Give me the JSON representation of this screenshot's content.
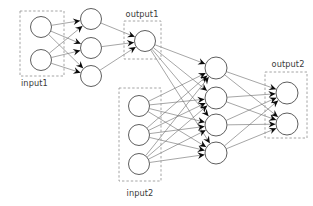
{
  "diagram": {
    "type": "neural-network",
    "canvas": {
      "width": 313,
      "height": 206
    },
    "style": {
      "background": "#ffffff",
      "node_fill": "#ffffff",
      "node_stroke": "#555555",
      "edge_color": "#6e6e6e",
      "box_color": "#9a9a9a",
      "arrow_color": "#0b0b0b",
      "label_color": "#3b3b3b"
    },
    "labels": {
      "input1": "input1",
      "output1": "output1",
      "input2": "input2",
      "output2": "output2"
    },
    "label_positions": {
      "input1": {
        "x": 21,
        "y": 86,
        "anchor": "start"
      },
      "output1": {
        "x": 142,
        "y": 17,
        "anchor": "middle"
      },
      "input2": {
        "x": 140,
        "y": 196,
        "anchor": "middle"
      },
      "output2": {
        "x": 288,
        "y": 67,
        "anchor": "middle"
      }
    },
    "groups": [
      {
        "id": "input1",
        "label": "input1",
        "x": 20,
        "y": 11,
        "width": 44,
        "height": 65
      },
      {
        "id": "output1",
        "label": "output1",
        "x": 124,
        "y": 21,
        "width": 37,
        "height": 38
      },
      {
        "id": "input2",
        "label": "input2",
        "x": 119,
        "y": 88,
        "width": 42,
        "height": 93
      },
      {
        "id": "output2",
        "label": "output2",
        "x": 265,
        "y": 72,
        "width": 42,
        "height": 66
      }
    ],
    "layers": [
      {
        "id": "input1",
        "name": "input layer 1",
        "node_radius": 10.5,
        "nodes": [
          {
            "id": "i1a",
            "cx": 41,
            "cy": 27
          },
          {
            "id": "i1b",
            "cx": 41,
            "cy": 60
          }
        ]
      },
      {
        "id": "hidden1",
        "name": "hidden layer 1",
        "node_radius": 10.5,
        "nodes": [
          {
            "id": "h1a",
            "cx": 91,
            "cy": 19
          },
          {
            "id": "h1b",
            "cx": 91,
            "cy": 48
          },
          {
            "id": "h1c",
            "cx": 91,
            "cy": 76
          }
        ]
      },
      {
        "id": "output1",
        "name": "output layer 1",
        "node_radius": 10.5,
        "nodes": [
          {
            "id": "o1a",
            "cx": 145,
            "cy": 41
          }
        ]
      },
      {
        "id": "input2",
        "name": "input layer 2",
        "node_radius": 10.5,
        "nodes": [
          {
            "id": "i2a",
            "cx": 139,
            "cy": 106
          },
          {
            "id": "i2b",
            "cx": 139,
            "cy": 135
          },
          {
            "id": "i2c",
            "cx": 139,
            "cy": 164
          }
        ]
      },
      {
        "id": "hidden2",
        "name": "hidden layer 2",
        "node_radius": 11,
        "nodes": [
          {
            "id": "h2a",
            "cx": 216,
            "cy": 68
          },
          {
            "id": "h2b",
            "cx": 216,
            "cy": 98
          },
          {
            "id": "h2c",
            "cx": 216,
            "cy": 125
          },
          {
            "id": "h2d",
            "cx": 216,
            "cy": 153
          }
        ]
      },
      {
        "id": "output2",
        "name": "output layer 2",
        "node_radius": 11,
        "nodes": [
          {
            "id": "o2a",
            "cx": 287,
            "cy": 93
          },
          {
            "id": "o2b",
            "cx": 287,
            "cy": 124
          }
        ]
      }
    ],
    "connections": [
      {
        "from": "input1",
        "to": "hidden1",
        "kind": "full",
        "arrow": true
      },
      {
        "from": "hidden1",
        "to": "output1",
        "kind": "full",
        "arrow": true
      },
      {
        "from": "output1",
        "to": "hidden2",
        "kind": "full",
        "arrow": true
      },
      {
        "from": "input2",
        "to": "hidden2",
        "kind": "full",
        "arrow": true
      },
      {
        "from": "hidden2",
        "to": "output2",
        "kind": "full",
        "arrow": true
      }
    ]
  }
}
